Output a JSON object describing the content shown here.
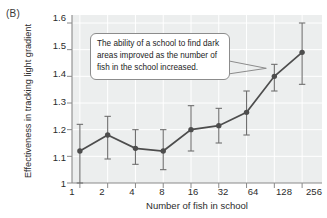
{
  "figure": {
    "panel_label": "(B)",
    "callout_text": "The ability of a school to find dark areas improved as the number of fish in the school increased."
  },
  "chart_data": {
    "type": "line",
    "title": "",
    "xlabel": "Number of fish in school",
    "ylabel": "Effectiveness in tracking light gradient",
    "categories": [
      "1",
      "2",
      "4",
      "8",
      "16",
      "32",
      "64",
      "128",
      "256"
    ],
    "x_tick_labels": [
      "1",
      "2",
      "4",
      "8",
      "16",
      "32",
      "64",
      "128",
      "256"
    ],
    "y_tick_labels": [
      "1",
      "1.1",
      "1.2",
      "1.3",
      "1.4",
      "1.5",
      "1.6"
    ],
    "y_ticks": [
      1,
      1.1,
      1.2,
      1.3,
      1.4,
      1.5,
      1.6
    ],
    "ylim": [
      1.0,
      1.63
    ],
    "grid": true,
    "legend": "none",
    "series": [
      {
        "name": "Effectiveness in tracking light gradient",
        "values": [
          1.12,
          1.18,
          1.13,
          1.12,
          1.2,
          1.215,
          1.265,
          1.4,
          1.49
        ],
        "error_low": [
          1.0,
          1.09,
          1.07,
          1.05,
          1.12,
          1.15,
          1.18,
          1.345,
          1.37
        ],
        "error_high": [
          1.22,
          1.25,
          1.2,
          1.2,
          1.29,
          1.28,
          1.345,
          1.445,
          1.6
        ],
        "marker": "circle",
        "color": "#4d4d4d"
      }
    ],
    "plot_background": "#eceeee",
    "line_color": "#4d4d4d",
    "grid_color": "#ffffff"
  }
}
